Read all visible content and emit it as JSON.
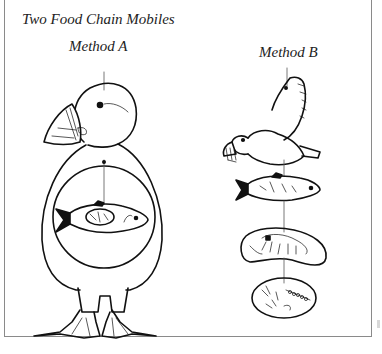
{
  "figure": {
    "title": "Two Food Chain Mobiles",
    "methods": [
      {
        "label": "Method A",
        "description": "Nested mobile: puffin outline containing a circle, containing a fish, containing plankton",
        "levels": [
          "puffin",
          "fish",
          "zooplankton",
          "phytoplankton"
        ]
      },
      {
        "label": "Method B",
        "description": "Hanging chain mobile: flying puffin, fish, krill oval, plankton oval connected by strings",
        "levels": [
          "puffin",
          "fish",
          "krill",
          "plankton"
        ]
      }
    ]
  },
  "colors": {
    "line": "#111111",
    "string": "#555555",
    "border": "#8a8a8a",
    "background": "#ffffff"
  }
}
